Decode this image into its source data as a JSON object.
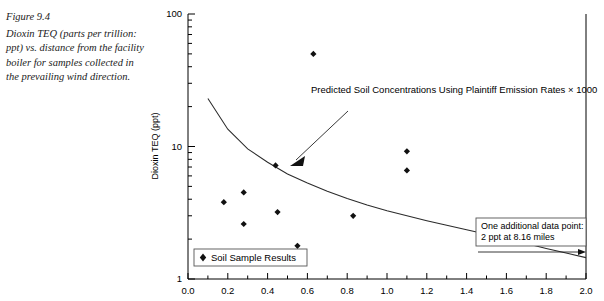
{
  "caption": {
    "figure_number": "Figure 9.4",
    "text": "Dioxin TEQ (parts per trillion: ppt) vs. distance from the facility boiler for samples collected in the prevailing wind direction."
  },
  "chart_data": {
    "type": "scatter",
    "title": "",
    "xlabel": "",
    "ylabel": "Dioxin TEQ (ppt)",
    "xlim": [
      0.0,
      2.0
    ],
    "ylim": [
      1,
      100
    ],
    "yscale": "log",
    "xscale": "linear",
    "grid": false,
    "xticks": [
      "0.0",
      "0.2",
      "0.4",
      "0.6",
      "0.8",
      "1.0",
      "1.2",
      "1.4",
      "1.6",
      "1.8",
      "2.0"
    ],
    "xtick_values": [
      0.0,
      0.2,
      0.4,
      0.6,
      0.8,
      1.0,
      1.2,
      1.4,
      1.6,
      1.8,
      2.0
    ],
    "yticks": [
      "1",
      "10",
      "100"
    ],
    "ytick_values": [
      1,
      10,
      100
    ],
    "series": [
      {
        "name": "Soil Sample Results",
        "type": "scatter",
        "marker": "diamond",
        "color": "#111111",
        "points": [
          {
            "x": 0.18,
            "y": 3.8
          },
          {
            "x": 0.28,
            "y": 4.5
          },
          {
            "x": 0.28,
            "y": 2.6
          },
          {
            "x": 0.44,
            "y": 7.2
          },
          {
            "x": 0.45,
            "y": 3.2
          },
          {
            "x": 0.55,
            "y": 1.78
          },
          {
            "x": 0.55,
            "y": 1.58
          },
          {
            "x": 0.63,
            "y": 50.0
          },
          {
            "x": 0.83,
            "y": 3.0
          },
          {
            "x": 1.1,
            "y": 9.2
          },
          {
            "x": 1.1,
            "y": 6.6
          }
        ]
      },
      {
        "name": "Predicted Soil Concentrations Using Plaintiff Emission Rates × 1000",
        "type": "line",
        "color": "#2b2b2b",
        "points": [
          {
            "x": 0.1,
            "y": 23.0
          },
          {
            "x": 0.2,
            "y": 13.5
          },
          {
            "x": 0.3,
            "y": 9.6
          },
          {
            "x": 0.4,
            "y": 7.6
          },
          {
            "x": 0.5,
            "y": 6.2
          },
          {
            "x": 0.6,
            "y": 5.3
          },
          {
            "x": 0.7,
            "y": 4.6
          },
          {
            "x": 0.8,
            "y": 4.05
          },
          {
            "x": 0.9,
            "y": 3.62
          },
          {
            "x": 1.0,
            "y": 3.28
          },
          {
            "x": 1.1,
            "y": 3.0
          },
          {
            "x": 1.2,
            "y": 2.75
          },
          {
            "x": 1.3,
            "y": 2.54
          },
          {
            "x": 1.4,
            "y": 2.35
          },
          {
            "x": 1.5,
            "y": 2.18
          },
          {
            "x": 1.6,
            "y": 2.0
          },
          {
            "x": 1.7,
            "y": 1.85
          },
          {
            "x": 1.8,
            "y": 1.7
          },
          {
            "x": 1.9,
            "y": 1.57
          },
          {
            "x": 2.0,
            "y": 1.45
          }
        ]
      }
    ],
    "annotations": [
      {
        "name": "curve-label",
        "text": "Predicted Soil Concentrations Using Plaintiff Emission Rates × 1000",
        "has_arrow": true
      },
      {
        "name": "extra-point-note",
        "line1": "One additional data point:",
        "line2": "2 ppt at 8.16 miles",
        "has_arrow": true
      }
    ],
    "legend": {
      "position": "bottom-left",
      "entries": [
        {
          "label": "Soil Sample Results",
          "marker": "diamond",
          "color": "#111111"
        }
      ]
    }
  }
}
